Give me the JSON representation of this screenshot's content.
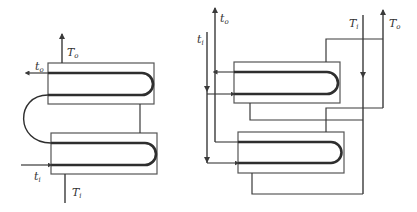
{
  "diagram": {
    "type": "heat-exchanger-arrangement",
    "colors": {
      "stroke": "#3a3a3a",
      "tube": "#2e2e2e",
      "shell": "#555555",
      "background": "#ffffff"
    },
    "left": {
      "title": "Two shells in series (hairpin, counterflow)",
      "labels": {
        "T_o": {
          "main": "T",
          "sub": "o"
        },
        "t_o": {
          "main": "t",
          "sub": "o"
        },
        "t_i": {
          "main": "t",
          "sub": "i"
        },
        "T_i": {
          "main": "T",
          "sub": "i"
        }
      }
    },
    "right": {
      "title": "Two shells in parallel (hairpin)",
      "labels": {
        "t_o": {
          "main": "t",
          "sub": "o"
        },
        "t_i": {
          "main": "t",
          "sub": "i"
        },
        "T_i": {
          "main": "T",
          "sub": "i"
        },
        "T_o": {
          "main": "T",
          "sub": "o"
        }
      }
    }
  }
}
